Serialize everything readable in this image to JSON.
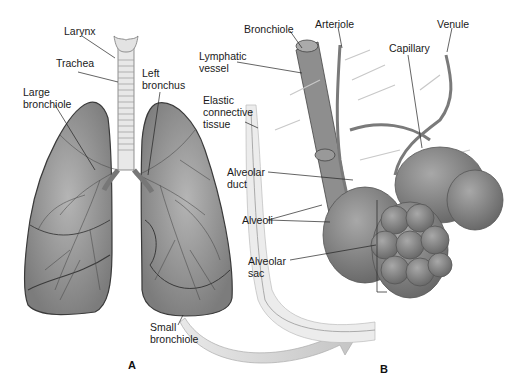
{
  "figure": {
    "panel_a": {
      "letter": "A",
      "labels": {
        "larynx": "Larynx",
        "trachea": "Trachea",
        "large_bronchiole": "Large\nbronchiole",
        "left_bronchus": "Left\nbronchus",
        "small_bronchiole": "Small\nbronchiole"
      }
    },
    "panel_b": {
      "letter": "B",
      "labels": {
        "bronchiole": "Bronchiole",
        "arteriole": "Arteriole",
        "venule": "Venule",
        "lymphatic_vessel": "Lymphatic\nvessel",
        "capillary": "Capillary",
        "elastic_connective_tissue": "Elastic\nconnective\ntissue",
        "alveolar_duct": "Alveolar\nduct",
        "alveoli": "Alveoli",
        "alveolar_sac": "Alveolar\nsac"
      }
    },
    "colors": {
      "lung_fill": "#8c8c8c",
      "lung_stroke": "#3a3a3a",
      "trachea": "#e6e6e6",
      "alveoli": "#7a7a7a",
      "arrow": "#cfcfcf",
      "label_text": "#1a1a1a"
    }
  }
}
